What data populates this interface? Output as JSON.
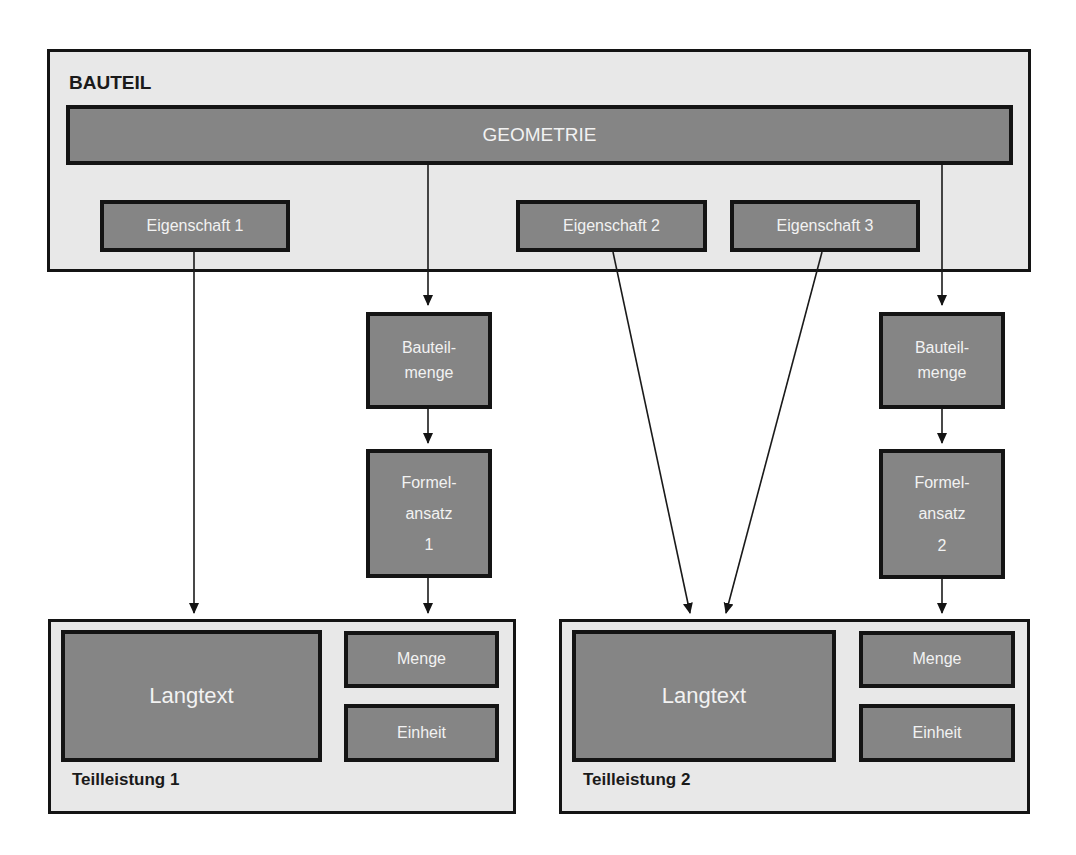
{
  "bauteil": {
    "title": "BAUTEIL",
    "geometrie": "GEOMETRIE",
    "eigenschaften": [
      "Eigenschaft 1",
      "Eigenschaft 2",
      "Eigenschaft 3"
    ]
  },
  "flows": [
    {
      "bauteilmenge": [
        "Bauteil-",
        "menge"
      ],
      "formelansatz": [
        "Formel-",
        "ansatz",
        "1"
      ]
    },
    {
      "bauteilmenge": [
        "Bauteil-",
        "menge"
      ],
      "formelansatz": [
        "Formel-",
        "ansatz",
        "2"
      ]
    }
  ],
  "teilleistungen": [
    {
      "title": "Teilleistung 1",
      "langtext": "Langtext",
      "menge": "Menge",
      "einheit": "Einheit"
    },
    {
      "title": "Teilleistung 2",
      "langtext": "Langtext",
      "menge": "Menge",
      "einheit": "Einheit"
    }
  ],
  "colors": {
    "container_fill": "#e8e8e8",
    "box_fill": "#858585",
    "border": "#141414",
    "box_text": "#f2f2f2"
  }
}
